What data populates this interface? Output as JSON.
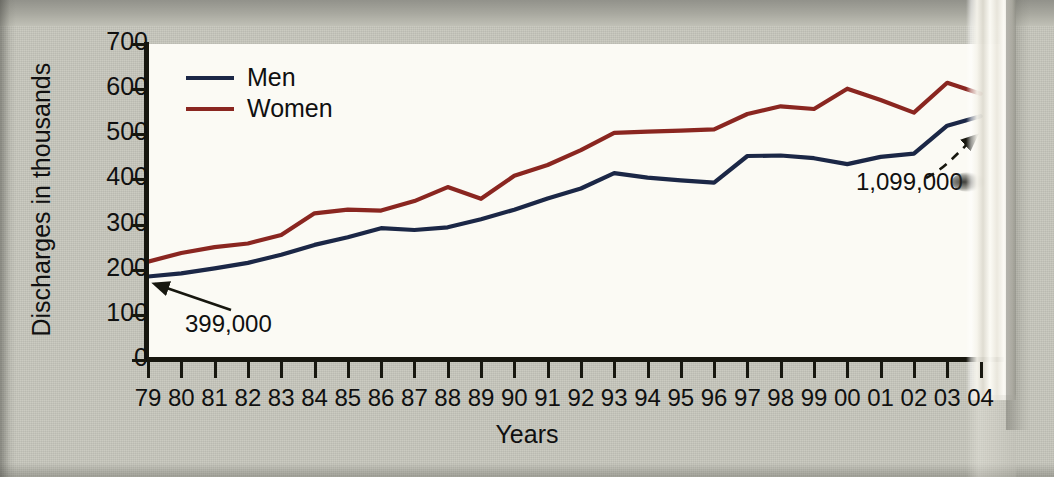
{
  "chart_data": {
    "type": "line",
    "title": "",
    "xlabel": "Years",
    "ylabel": "Discharges in thousands",
    "categories": [
      "79",
      "80",
      "81",
      "82",
      "83",
      "84",
      "85",
      "86",
      "87",
      "88",
      "89",
      "90",
      "91",
      "92",
      "93",
      "94",
      "95",
      "96",
      "97",
      "98",
      "99",
      "00",
      "01",
      "02",
      "03",
      "04"
    ],
    "ylim": [
      0,
      700
    ],
    "xlim_labels": [
      "79",
      "04"
    ],
    "grid": false,
    "legend_position": "top-left",
    "series": [
      {
        "name": "Men",
        "color": "#1b2746",
        "values": [
          185,
          192,
          203,
          215,
          233,
          255,
          272,
          292,
          288,
          294,
          312,
          333,
          358,
          380,
          414,
          404,
          398,
          393,
          452,
          453,
          447,
          434,
          450,
          457,
          519,
          540
        ]
      },
      {
        "name": "Women",
        "color": "#8a2620",
        "values": [
          218,
          237,
          250,
          258,
          277,
          325,
          333,
          331,
          352,
          383,
          357,
          408,
          432,
          465,
          503,
          506,
          508,
          511,
          545,
          562,
          556,
          601,
          576,
          548,
          614,
          590
        ]
      }
    ],
    "annotations": [
      {
        "name": "men-1979-callout",
        "text": "399,000",
        "points_to_series": "Men",
        "points_to_category": "79"
      },
      {
        "name": "men-2004-callout",
        "text": "1,099,000",
        "points_to_series": "Men",
        "points_to_category": "04",
        "partially_obscured": true
      }
    ]
  },
  "axes": {
    "y_ticks": [
      "700",
      "600",
      "500",
      "400",
      "300",
      "200",
      "100",
      "0"
    ],
    "y_title": "Discharges in thousands",
    "x_title": "Years",
    "x_ticks": [
      "79",
      "80",
      "81",
      "82",
      "83",
      "84",
      "85",
      "86",
      "87",
      "88",
      "89",
      "90",
      "91",
      "92",
      "93",
      "94",
      "95",
      "96",
      "97",
      "98",
      "99",
      "00",
      "01",
      "02",
      "03",
      "04"
    ]
  },
  "legend": {
    "items": [
      {
        "label": "Men",
        "color": "#1b2746"
      },
      {
        "label": "Women",
        "color": "#8a2620"
      }
    ]
  },
  "annotations": {
    "left_label": "399,000",
    "right_label": "1,099,000"
  },
  "colors": {
    "men": "#1b2746",
    "women": "#8a2620",
    "paper": "#c7c7bd",
    "plot_background": "#fbfaf4",
    "axis": "#17170f",
    "text": "#101010"
  }
}
